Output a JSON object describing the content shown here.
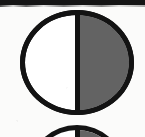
{
  "figure": {
    "caption_text": "",
    "background_color": "#fbfbfa",
    "stroke_color": "#131313",
    "shade_color": "#636363",
    "unshaded_color": "#ffffff"
  },
  "rule": {
    "name": "horizontal-rule",
    "color": "#151515"
  },
  "symbols": [
    {
      "name": "half-shaded-circle",
      "left_half": "unshaded",
      "left_half_color": "#ffffff",
      "right_half": "shaded",
      "right_half_color": "#636363",
      "divider": "vertical",
      "outline_color": "#131313"
    },
    {
      "name": "half-shaded-circle-cropped",
      "left_half": "unshaded",
      "left_half_color": "#ffffff",
      "right_half": "shaded",
      "right_half_color": "#636363",
      "divider": "vertical",
      "outline_color": "#131313"
    }
  ]
}
